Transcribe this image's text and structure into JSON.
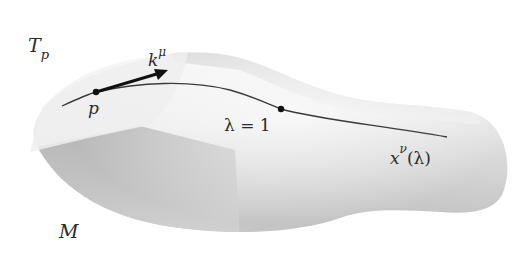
{
  "figure": {
    "type": "spacetime-manifold-diagram",
    "colors": {
      "background": "#ffffff",
      "manifold_light": "#f2f2f2",
      "manifold_mid": "#d6d6d6",
      "manifold_dark": "#a9a9a9",
      "tangent_plane": "#ebebeb",
      "curve": "#3a3a3a",
      "vector": "#111111",
      "points": "#111111",
      "text": "#2a2a2a"
    },
    "labels": {
      "tangent_space": {
        "main": "T",
        "sub": "p"
      },
      "vector": {
        "main": "k",
        "sup": "μ"
      },
      "point": "p",
      "parameter_point": "λ = 1",
      "curve": {
        "main": "x",
        "sup": "ν",
        "arg": "(λ)"
      },
      "manifold": "M"
    },
    "points": [
      {
        "name": "p",
        "x": 96,
        "y": 92
      },
      {
        "name": "lambda-1",
        "x": 281,
        "y": 109
      }
    ]
  }
}
